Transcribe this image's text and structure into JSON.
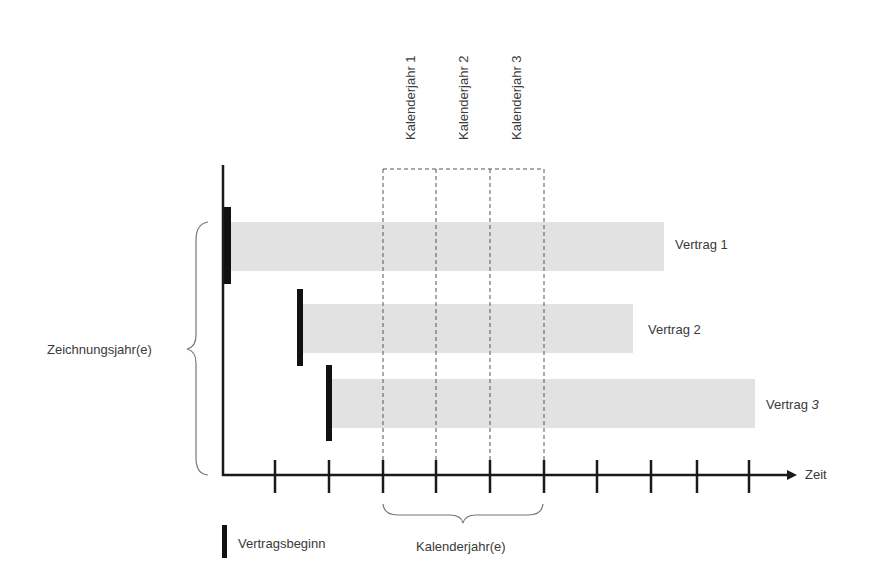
{
  "diagram": {
    "type": "timeline",
    "axis": {
      "x_label": "Zeit"
    },
    "calendar_years": [
      {
        "label": "Kalenderjahr 1"
      },
      {
        "label": "Kalenderjahr 2"
      },
      {
        "label": "Kalenderjahr 3"
      }
    ],
    "contracts": [
      {
        "label": "Vertrag",
        "number": "1",
        "number_italic": false
      },
      {
        "label": "Vertrag",
        "number": "2",
        "number_italic": false
      },
      {
        "label": "Vertrag",
        "number": "3",
        "number_italic": true
      }
    ],
    "brace_labels": {
      "left": "Zeichnungsjahr(e)",
      "bottom": "Kalenderjahr(e)"
    },
    "legend": {
      "marker_label": "Vertragsbeginn"
    },
    "colors": {
      "axis": "#1a1a1a",
      "bar_fill": "#e2e2e2",
      "marker": "#111111",
      "dashed": "#555555",
      "brace": "#777777",
      "text": "#3a3a3a"
    }
  }
}
